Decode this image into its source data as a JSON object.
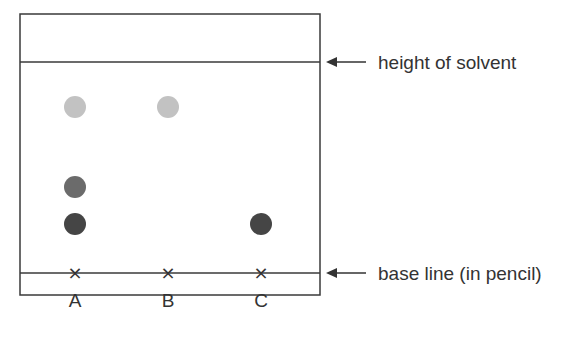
{
  "diagram": {
    "type": "chromatography",
    "lanes": [
      {
        "label": "A",
        "x": 75,
        "spots": [
          {
            "y": 107,
            "color": "#c2c2c2",
            "shade": "light"
          },
          {
            "y": 187,
            "color": "#6b6b6b",
            "shade": "medium"
          },
          {
            "y": 224,
            "color": "#454545",
            "shade": "dark"
          }
        ]
      },
      {
        "label": "B",
        "x": 168,
        "spots": [
          {
            "y": 107,
            "color": "#c2c2c2",
            "shade": "light"
          }
        ]
      },
      {
        "label": "C",
        "x": 261,
        "spots": [
          {
            "y": 224,
            "color": "#454545",
            "shade": "dark"
          }
        ]
      }
    ],
    "annotations": {
      "solvent": "height of solvent",
      "baseline": "base line (in pencil)"
    },
    "start_marker": "×"
  }
}
